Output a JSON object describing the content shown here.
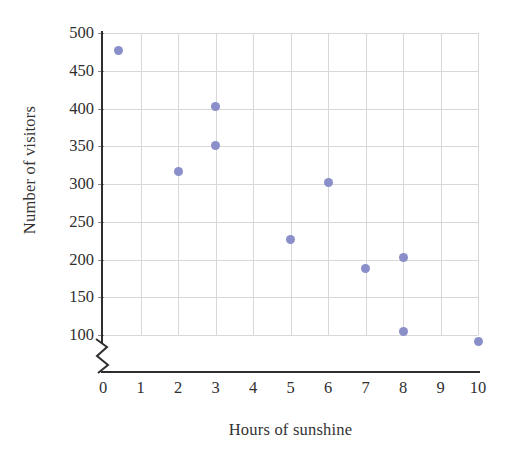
{
  "chart_data": {
    "type": "scatter",
    "title": "",
    "xlabel": "Hours of sunshine",
    "ylabel": "Number of visitors",
    "xlim": [
      0,
      10
    ],
    "ylim": [
      75,
      500
    ],
    "y_axis_broken": true,
    "grid": true,
    "legend": "none",
    "marker_color": "#8a8fc9",
    "gridline_color": "#d8d8d8",
    "axis_color": "#2e2e2e",
    "xticks": [
      0,
      1,
      2,
      3,
      4,
      5,
      6,
      7,
      8,
      9,
      10
    ],
    "yticks": [
      100,
      150,
      200,
      250,
      300,
      350,
      400,
      450,
      500
    ],
    "xtick_labels": [
      "0",
      "1",
      "2",
      "3",
      "4",
      "5",
      "6",
      "7",
      "8",
      "9",
      "10"
    ],
    "ytick_labels": [
      "100",
      "150",
      "200",
      "250",
      "300",
      "350",
      "400",
      "450",
      "500"
    ],
    "points": [
      {
        "x": 0.4,
        "y": 477
      },
      {
        "x": 2.0,
        "y": 316
      },
      {
        "x": 3.0,
        "y": 402
      },
      {
        "x": 3.0,
        "y": 351
      },
      {
        "x": 5.0,
        "y": 226
      },
      {
        "x": 6.0,
        "y": 302
      },
      {
        "x": 7.0,
        "y": 188
      },
      {
        "x": 8.0,
        "y": 203
      },
      {
        "x": 8.0,
        "y": 105
      },
      {
        "x": 10.0,
        "y": 92
      }
    ]
  }
}
